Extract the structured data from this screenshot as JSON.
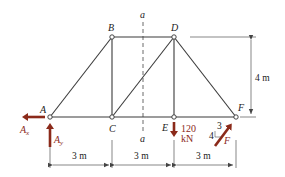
{
  "diagram": {
    "type": "plane truss",
    "joints": {
      "A": {
        "label": "A",
        "x": 0,
        "y": 0
      },
      "B": {
        "label": "B",
        "x": 3,
        "y": 4
      },
      "C": {
        "label": "C",
        "x": 3,
        "y": 0
      },
      "D": {
        "label": "D",
        "x": 6,
        "y": 4
      },
      "E": {
        "label": "E",
        "x": 6,
        "y": 0
      },
      "F": {
        "label": "F",
        "x": 9,
        "y": 0
      }
    },
    "members": [
      "AB",
      "AC",
      "BC",
      "BD",
      "CD",
      "CE",
      "DE",
      "DF",
      "EF"
    ],
    "section": {
      "label_top": "a",
      "label_bottom": "a"
    },
    "reactions": {
      "ax": "A",
      "ax_sub": "x",
      "ay": "A",
      "ay_sub": "y"
    },
    "loads": {
      "e_load_value": "120",
      "e_load_unit": "kN",
      "f_force_label": "F",
      "slope_rise": "3",
      "slope_run": "4"
    },
    "dimensions": {
      "span1": "3 m",
      "span2": "3 m",
      "span3": "3 m",
      "height": "4 m"
    },
    "colors": {
      "members": "#3a3a3a",
      "loads": "#8b2a1a"
    }
  }
}
